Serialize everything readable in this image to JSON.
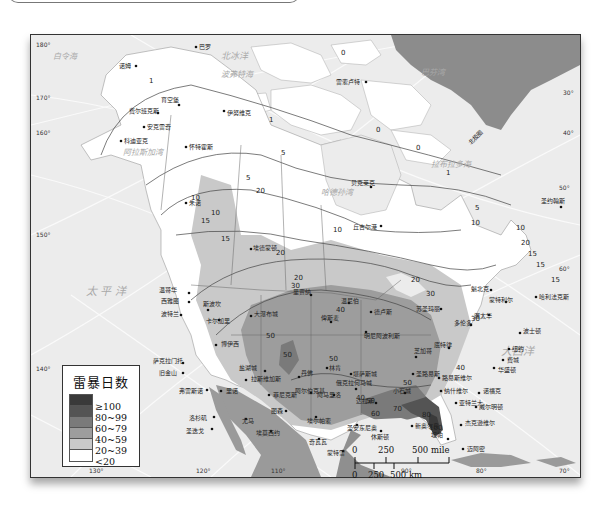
{
  "map": {
    "title": "北美洲雷暴日数分布",
    "legend": {
      "title": "雷暴日数",
      "items": [
        {
          "label": "≥100",
          "color": "#3a3a3a"
        },
        {
          "label": "80~99",
          "color": "#545454"
        },
        {
          "label": "60~79",
          "color": "#7a7a7a"
        },
        {
          "label": "40~59",
          "color": "#9d9d9d"
        },
        {
          "label": "20~39",
          "color": "#c9c9c9"
        },
        {
          "label": "<20",
          "color": "#ffffff"
        }
      ]
    },
    "scale": {
      "mile_labels": [
        "0",
        "250",
        "500 mile"
      ],
      "km_labels": [
        "0",
        "250",
        "500 km"
      ]
    },
    "seas": {
      "bering": "白令海",
      "arctic": "北冰洋",
      "beaufort": "波弗特海",
      "baffin": "巴芬湾",
      "labrador": "拉布拉多海",
      "alaska_gulf": "阿拉斯加湾",
      "hudson": "哈德孙湾",
      "pacific": "太 平 洋",
      "atlantic": "大西洋",
      "tropic": "北 回 归 线",
      "arctic_circle": "北极圈"
    },
    "longitudes": [
      "180°",
      "170°",
      "160°",
      "150°",
      "140°",
      "130°",
      "120°",
      "110°",
      "90°",
      "80°",
      "70°",
      "30°",
      "40°",
      "50°",
      "60°",
      "60°"
    ],
    "latitudes": [
      "50°",
      "40°",
      "30°",
      "20°",
      "70°",
      "70°",
      "20°",
      "30°",
      "60°"
    ],
    "cities": {
      "nome": "诺姆",
      "barrow": "巴罗",
      "fairbanks": "费尔班克斯",
      "circle": "育空堡",
      "inuvik": "伊努维克",
      "anchorage": "安克雷奇",
      "kodiak": "科迪亚克",
      "whitehorse": "怀特霍斯",
      "resolute": "雷索卢特",
      "bakerlake": "贝克莱克",
      "churchill": "丘吉尔港",
      "juneau": "朱诺",
      "stjohns": "圣约翰斯",
      "edmonton": "埃德蒙顿",
      "vancouver": "温哥华",
      "seattle": "西雅图",
      "portland": "波特兰",
      "spokane": "斯波坎",
      "calgary": "卡尔加里",
      "regina": "里贾纳",
      "winnipeg": "温尼伯",
      "saultstemarie": "苏圣玛丽",
      "quebec": "魁北克",
      "montreal": "蒙特利尔",
      "ottawa": "渥太华",
      "toronto": "多伦多",
      "halifax": "哈利法克斯",
      "boston": "波士顿",
      "newyork": "纽约",
      "philadelphia": "费城",
      "washington": "华盛顿",
      "detroit": "底特律",
      "chicago": "芝加哥",
      "minneapolis": "明尼阿波利斯",
      "duluth": "德卢斯",
      "bismarck": "俾斯麦",
      "greatfalls": "大瀑布城",
      "helena": "海伦娜",
      "boise": "博伊西",
      "reno": "里诺",
      "saltlake": "盐湖城",
      "sf": "萨克拉门托",
      "sanfrancisco": "旧金山",
      "fresno": "弗雷斯诺",
      "la": "洛杉矶",
      "sandiego": "圣迭戈",
      "lasvegas": "拉斯维加斯",
      "phoenix": "菲尼克斯",
      "denver": "丹佛",
      "cheyenne": "夏延",
      "rapidcity": "拉皮德城",
      "northplatte": "北普拉特",
      "lincoln": "林肯",
      "kansascity": "堪萨斯城",
      "stlouis": "圣路易斯",
      "louisville": "路易斯维尔",
      "nashville": "纳什维尔",
      "atlanta": "亚特兰大",
      "charleston": "查尔斯顿",
      "norfolk": "诺福克",
      "raleigh": "罗利",
      "wilmington": "威尔明顿",
      "jacksonville": "杰克逊维尔",
      "tampa": "坦帕",
      "miami": "迈阿密",
      "neworleans": "新奥尔良",
      "houston": "休斯顿",
      "dallas": "达拉斯",
      "oklahoma": "俄克拉何马城",
      "amarillo": "阿马里洛",
      "albuquerque": "阿尔伯克基",
      "elpaso": "埃尔帕索",
      "tucson": "图森",
      "yuma": "尤马",
      "chihuahua": "奇瓦瓦",
      "monterrey": "蒙特雷",
      "hermosillo": "埃莫西约",
      "sanantonio": "圣安东尼奥",
      "memphis": "孟菲斯",
      "littlerock": "小石城",
      "montgomery": "蒙哥马利",
      "jackson": "杰克逊",
      "shreveport": "什里夫波特",
      "pittsburgh": "匹兹堡",
      "cleveland": "克利夫兰",
      "indianapolis": "印第安纳波利斯",
      "milwaukee": "密尔沃基",
      "greenbay": "格林贝",
      "fargo": "法戈",
      "saskatoon": "萨斯卡通",
      "portlandme": "波特兰",
      "eureka": "尤里卡",
      "medford": "梅德福",
      "stjohn": "圣约翰"
    },
    "contours": [
      "0",
      "1",
      "5",
      "10",
      "15",
      "20",
      "30",
      "40",
      "50",
      "60",
      "70",
      "80",
      "100"
    ]
  }
}
